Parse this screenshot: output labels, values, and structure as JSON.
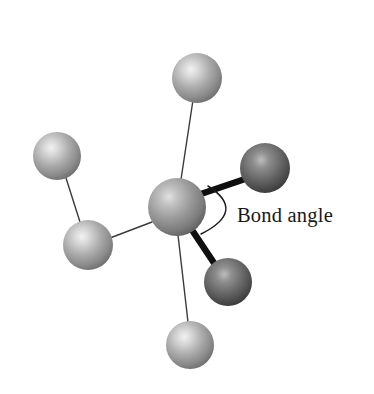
{
  "figure": {
    "title": "Bond angle",
    "type": "ball-and-stick molecular model",
    "width": 374,
    "height": 394,
    "background_color": "#ffffff"
  },
  "annotation": {
    "label": "Bond angle",
    "label_x": 237,
    "label_y": 222,
    "arc": {
      "start_x": 208,
      "start_y": 186,
      "end_x": 201,
      "end_y": 234,
      "control_x": 247,
      "control_y": 211,
      "color": "#1b1b1b"
    }
  },
  "colors": {
    "sphere_light_base": "#9a9a9a",
    "sphere_light_highlight": "#e9e9e9",
    "sphere_light_shadow": "#6e6e6e",
    "sphere_dark_base": "#5f5f5f",
    "sphere_dark_highlight": "#b4b4b4",
    "sphere_dark_shadow": "#2c2c2c",
    "sphere_center_base": "#8f8f8f",
    "bond_thin": "#3a3a3a",
    "bond_bold": "#100f10",
    "text": "#181818"
  },
  "atoms": [
    {
      "id": "central-atom",
      "label": "central atom",
      "cx": 177,
      "cy": 207,
      "r": 29,
      "shade": "center"
    },
    {
      "id": "atom-top",
      "label": "top atom",
      "cx": 197,
      "cy": 78,
      "r": 25,
      "shade": "light"
    },
    {
      "id": "atom-left",
      "label": "upper left atom",
      "cx": 57,
      "cy": 156,
      "r": 24,
      "shade": "light"
    },
    {
      "id": "atom-lower-left",
      "label": "lower left atom",
      "cx": 88,
      "cy": 245,
      "r": 25,
      "shade": "light"
    },
    {
      "id": "atom-bottom",
      "label": "bottom atom",
      "cx": 190,
      "cy": 345,
      "r": 24,
      "shade": "light"
    },
    {
      "id": "atom-right",
      "label": "upper right bonded atom",
      "cx": 265,
      "cy": 168,
      "r": 25,
      "shade": "dark"
    },
    {
      "id": "atom-lower-right",
      "label": "lower right bonded atom",
      "cx": 228,
      "cy": 282,
      "r": 24,
      "shade": "dark"
    }
  ],
  "bonds": [
    {
      "id": "bond-top",
      "label": "bond to top atom",
      "x1": 180,
      "y1": 186,
      "x2": 193,
      "y2": 100,
      "weight": "thin"
    },
    {
      "id": "bond-lower-left",
      "label": "bond to lower left atom",
      "x1": 152,
      "y1": 222,
      "x2": 110,
      "y2": 238,
      "weight": "thin"
    },
    {
      "id": "bond-bottom",
      "label": "bond to bottom atom",
      "x1": 178,
      "y1": 235,
      "x2": 188,
      "y2": 322,
      "weight": "thin"
    },
    {
      "id": "bond-left-pair",
      "label": "bond between left atoms",
      "x1": 66,
      "y1": 178,
      "x2": 80,
      "y2": 222,
      "weight": "thin"
    },
    {
      "id": "bond-right",
      "label": "bold bond to right atom",
      "x1": 192,
      "y1": 197,
      "x2": 248,
      "y2": 178,
      "weight": "bold"
    },
    {
      "id": "bond-lower-right",
      "label": "bold bond to lower right atom",
      "x1": 186,
      "y1": 221,
      "x2": 216,
      "y2": 266,
      "weight": "bold"
    }
  ]
}
